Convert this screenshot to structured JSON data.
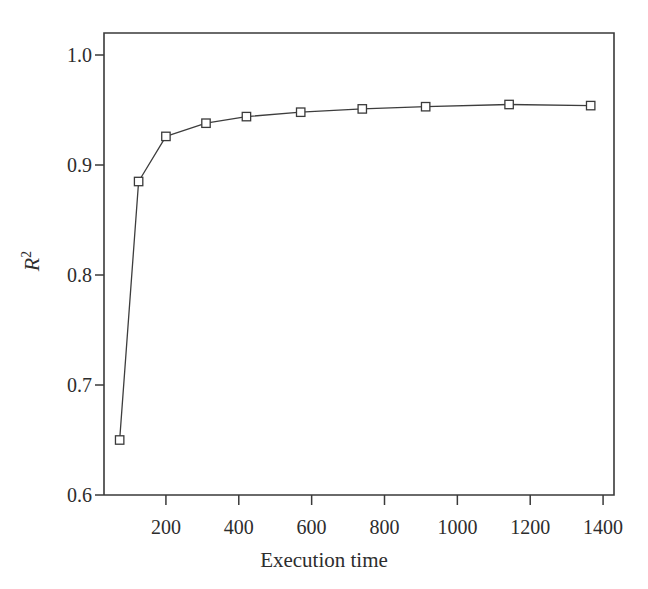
{
  "chart_data": {
    "type": "line",
    "title": "",
    "subtitle": "",
    "xlabel": "Execution time",
    "ylabel_text": "R",
    "ylabel_superscript": "2",
    "ylabel": "R^2",
    "xlim": [
      30,
      1430
    ],
    "ylim": [
      0.6,
      1.02
    ],
    "grid": false,
    "legend": null,
    "xticks": [
      200,
      400,
      600,
      800,
      1000,
      1200,
      1400
    ],
    "xtick_labels": [
      "200",
      "400",
      "600",
      "800",
      "1000",
      "1200",
      "1400"
    ],
    "yticks": [
      0.6,
      0.7,
      0.8,
      0.9,
      1.0
    ],
    "ytick_labels": [
      "0.6",
      "0.7",
      "0.8",
      "0.9",
      "1.0"
    ],
    "marker": "square-open",
    "line_color": "#3d3d3d",
    "marker_color": "#3a3a3a",
    "axis_color": "#3a3a3a",
    "background_color": "#ffffff",
    "x": [
      73,
      125,
      200,
      310,
      421,
      570,
      739,
      913,
      1142,
      1366
    ],
    "y": [
      0.65,
      0.885,
      0.926,
      0.938,
      0.944,
      0.948,
      0.951,
      0.953,
      0.955,
      0.954
    ],
    "points": [
      {
        "x": 73,
        "y": 0.65
      },
      {
        "x": 125,
        "y": 0.885
      },
      {
        "x": 200,
        "y": 0.926
      },
      {
        "x": 310,
        "y": 0.938
      },
      {
        "x": 421,
        "y": 0.944
      },
      {
        "x": 570,
        "y": 0.948
      },
      {
        "x": 739,
        "y": 0.951
      },
      {
        "x": 913,
        "y": 0.953
      },
      {
        "x": 1142,
        "y": 0.955
      },
      {
        "x": 1366,
        "y": 0.954
      }
    ]
  }
}
